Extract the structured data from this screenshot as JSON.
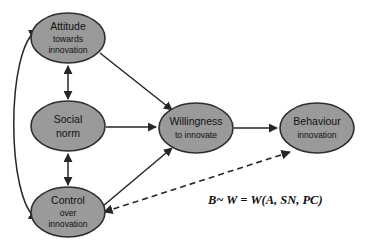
{
  "diagram": {
    "background_color": "#ffffff",
    "node_fill_color": "#9a9a9a",
    "node_border_color": "#2e2e2e",
    "edge_color": "#262626",
    "text_color": "#111111",
    "nodes": [
      {
        "id": "attitude",
        "line1": "Attitude",
        "line2": "towards",
        "line3": "innovation",
        "cx": 68,
        "cy": 38,
        "rx": 37,
        "ry": 25
      },
      {
        "id": "social-norm",
        "line1": "Social",
        "line2": "norm",
        "line3": "",
        "cx": 68,
        "cy": 126,
        "rx": 37,
        "ry": 25
      },
      {
        "id": "control",
        "line1": "Control",
        "line2": "over",
        "line3": "innovation",
        "cx": 68,
        "cy": 212,
        "rx": 37,
        "ry": 25
      },
      {
        "id": "willingness",
        "line1": "Willingness",
        "line2": "to innovate",
        "line3": "",
        "cx": 196,
        "cy": 128,
        "rx": 37,
        "ry": 25
      },
      {
        "id": "behaviour",
        "line1": "Behaviour",
        "line2": "innovation",
        "line3": "",
        "cx": 317,
        "cy": 128,
        "rx": 37,
        "ry": 25
      }
    ],
    "edges": [
      {
        "id": "attitude-social",
        "from": "attitude",
        "to": "social-norm",
        "style": "solid",
        "arrows": "both"
      },
      {
        "id": "social-control",
        "from": "social-norm",
        "to": "control",
        "style": "solid",
        "arrows": "both"
      },
      {
        "id": "attitude-control-curve",
        "from": "attitude",
        "to": "control",
        "style": "solid",
        "arrows": "both"
      },
      {
        "id": "attitude-willingness",
        "from": "attitude",
        "to": "willingness",
        "style": "solid",
        "arrows": "end"
      },
      {
        "id": "social-willingness",
        "from": "social-norm",
        "to": "willingness",
        "style": "solid",
        "arrows": "end"
      },
      {
        "id": "control-willingness",
        "from": "control",
        "to": "willingness",
        "style": "solid",
        "arrows": "end"
      },
      {
        "id": "willingness-behaviour",
        "from": "willingness",
        "to": "behaviour",
        "style": "solid",
        "arrows": "end"
      },
      {
        "id": "control-behaviour-dashed",
        "from": "control",
        "to": "behaviour",
        "style": "dashed",
        "arrows": "both"
      }
    ],
    "annotation": {
      "formula": "B~ W = W(A, SN, PC)",
      "x": 208,
      "y": 204
    }
  }
}
